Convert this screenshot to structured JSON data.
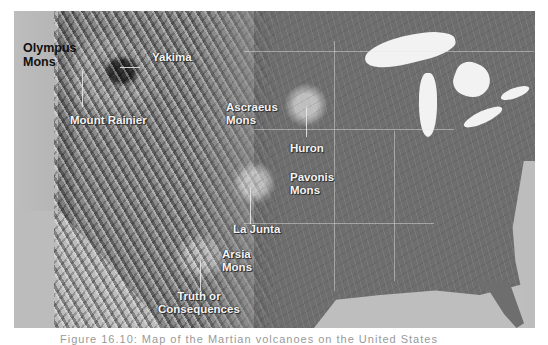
{
  "map": {
    "type": "shaded-relief map of the contiguous United States",
    "labels": {
      "olympus_mons": "Olympus\nMons",
      "olympus_line1": "Olympus",
      "olympus_line2": "Mons",
      "yakima": "Yakima",
      "mount_rainier": "Mount Rainier",
      "ascraeus_line1": "Ascraeus",
      "ascraeus_line2": "Mons",
      "huron": "Huron",
      "pavonis_line1": "Pavonis",
      "pavonis_line2": "Mons",
      "la_junta": "La Junta",
      "arsia_line1": "Arsia",
      "arsia_line2": "Mons",
      "truth_line1": "Truth or",
      "truth_line2": "Consequences"
    }
  },
  "credit": "Image: DSP.",
  "caption": "Figure 16.10: Map of the Martian volcanoes on the United States"
}
